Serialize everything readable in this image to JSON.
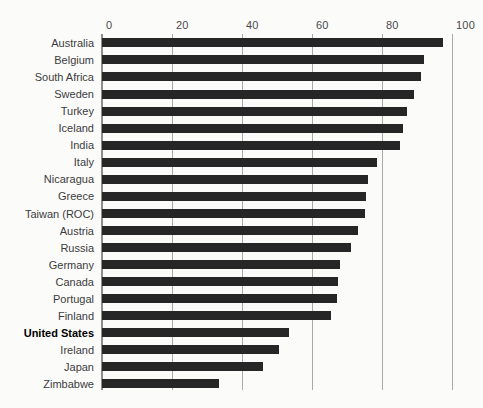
{
  "chart_data": {
    "type": "bar",
    "orientation": "horizontal",
    "title": "",
    "subtitle": "",
    "xlabel": "",
    "ylabel": "",
    "xlim": [
      0,
      100
    ],
    "ylim": null,
    "grid": "vertical",
    "legend": null,
    "xticks": [
      0,
      20,
      40,
      60,
      80,
      100
    ],
    "xtick_labels": [
      "0",
      "20",
      "40",
      "60",
      "80",
      "100"
    ],
    "bar_color": "#262626",
    "highlight_category": "United States",
    "categories": [
      "Australia",
      "Belgium",
      "South Africa",
      "Sweden",
      "Turkey",
      "Iceland",
      "India",
      "Italy",
      "Nicaragua",
      "Greece",
      "Taiwan (ROC)",
      "Austria",
      "Russia",
      "Germany",
      "Canada",
      "Portugal",
      "Finland",
      "United States",
      "Ireland",
      "Japan",
      "Zimbabwe"
    ],
    "values": [
      97.5,
      92,
      91,
      89,
      87,
      86,
      85,
      78.5,
      76,
      75.5,
      75,
      73,
      71,
      68,
      67.5,
      67,
      65.5,
      53.5,
      50.5,
      46,
      33.5
    ]
  }
}
